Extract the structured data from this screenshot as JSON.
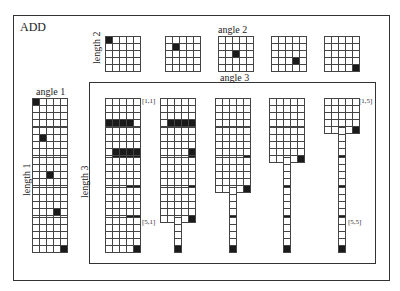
{
  "title": "ADD",
  "labels": {
    "angle1": "angle  1",
    "angle2": "angle  2",
    "angle3": "angle  3",
    "length1": "length  1",
    "length2": "length  2",
    "length3": "length  3"
  },
  "tags": {
    "t11": "[1,1]",
    "t15": "[1,5]",
    "t51": "[5,1]",
    "t55": "[5,5]"
  },
  "colors": {
    "ink": "#1a1a1a",
    "line": "#444444",
    "bg": "#ffffff"
  },
  "angle2_grids": [
    {
      "rows": 5,
      "cols": 5,
      "on": [
        [
          0,
          0
        ]
      ]
    },
    {
      "rows": 5,
      "cols": 5,
      "on": [
        [
          1,
          1
        ]
      ]
    },
    {
      "rows": 5,
      "cols": 5,
      "on": [
        [
          2,
          2
        ]
      ]
    },
    {
      "rows": 5,
      "cols": 5,
      "on": [
        [
          3,
          3
        ]
      ]
    },
    {
      "rows": 5,
      "cols": 5,
      "on": [
        [
          4,
          4
        ]
      ]
    }
  ],
  "angle1_grids": [
    {
      "rows": 5,
      "cols": 5,
      "on": [
        [
          0,
          0
        ]
      ]
    },
    {
      "rows": 5,
      "cols": 5,
      "on": [
        [
          1,
          1
        ]
      ]
    },
    {
      "rows": 5,
      "cols": 5,
      "on": [
        [
          2,
          2
        ]
      ]
    },
    {
      "rows": 5,
      "cols": 5,
      "on": [
        [
          3,
          3
        ]
      ]
    },
    {
      "rows": 5,
      "cols": 5,
      "on": [
        [
          4,
          4
        ]
      ]
    }
  ],
  "matrix": [
    [
      {
        "rows": 5,
        "cols": 5,
        "on": [
          [
            3,
            0
          ],
          [
            3,
            1
          ],
          [
            3,
            2
          ],
          [
            3,
            3
          ]
        ]
      },
      {
        "rows": 5,
        "cols": 5,
        "on": [
          [
            3,
            1
          ],
          [
            3,
            2
          ],
          [
            3,
            3
          ],
          [
            3,
            4
          ],
          [
            4,
            1
          ],
          [
            4,
            2
          ],
          [
            4,
            3
          ],
          [
            4,
            4
          ]
        ]
      },
      {
        "rows": 5,
        "cols": 5,
        "on": [
          [
            4,
            3
          ],
          [
            4,
            4
          ]
        ]
      },
      {
        "rows": 5,
        "cols": 5,
        "on": [
          [
            4,
            3
          ],
          [
            4,
            4
          ]
        ]
      },
      {
        "rows": 5,
        "cols": 5,
        "on": [
          [
            4,
            4
          ]
        ]
      }
    ],
    [
      {
        "rows": 5,
        "cols": 5,
        "on": [
          [
            3,
            1
          ],
          [
            3,
            2
          ],
          [
            3,
            3
          ],
          [
            3,
            4
          ],
          [
            4,
            1
          ],
          [
            4,
            2
          ],
          [
            4,
            3
          ],
          [
            4,
            4
          ]
        ]
      },
      {
        "rows": 5,
        "cols": 5,
        "on": [
          [
            3,
            4
          ],
          [
            4,
            4
          ]
        ]
      },
      {
        "rows": 5,
        "cols": 5,
        "on": [
          [
            4,
            4
          ]
        ]
      },
      {
        "rows": 5,
        "cols": 5,
        "on": [
          [
            4,
            4
          ]
        ]
      },
      {
        "rows": 5,
        "cols": 1,
        "on": [
          [
            4,
            0
          ]
        ]
      }
    ],
    [
      {
        "rows": 5,
        "cols": 5,
        "on": [
          [
            4,
            3
          ],
          [
            4,
            4
          ]
        ]
      },
      {
        "rows": 5,
        "cols": 5,
        "on": [
          [
            4,
            4
          ]
        ]
      },
      {
        "rows": 5,
        "cols": 5,
        "on": [
          [
            4,
            4
          ]
        ]
      },
      {
        "rows": 5,
        "cols": 1,
        "on": [
          [
            4,
            0
          ]
        ]
      },
      {
        "rows": 5,
        "cols": 1,
        "on": [
          [
            4,
            0
          ]
        ]
      }
    ],
    [
      {
        "rows": 5,
        "cols": 5,
        "on": [
          [
            4,
            3
          ],
          [
            4,
            4
          ]
        ]
      },
      {
        "rows": 5,
        "cols": 5,
        "on": [
          [
            4,
            4
          ]
        ]
      },
      {
        "rows": 5,
        "cols": 1,
        "on": [
          [
            4,
            0
          ]
        ]
      },
      {
        "rows": 5,
        "cols": 1,
        "on": [
          [
            4,
            0
          ]
        ]
      },
      {
        "rows": 5,
        "cols": 1,
        "on": [
          [
            4,
            0
          ]
        ]
      }
    ],
    [
      {
        "rows": 5,
        "cols": 5,
        "on": [
          [
            4,
            4
          ]
        ]
      },
      {
        "rows": 5,
        "cols": 1,
        "on": [
          [
            4,
            0
          ]
        ]
      },
      {
        "rows": 5,
        "cols": 1,
        "on": [
          [
            4,
            0
          ]
        ]
      },
      {
        "rows": 5,
        "cols": 1,
        "on": [
          [
            4,
            0
          ]
        ]
      },
      {
        "rows": 5,
        "cols": 1,
        "on": [
          [
            4,
            0
          ]
        ]
      }
    ]
  ]
}
